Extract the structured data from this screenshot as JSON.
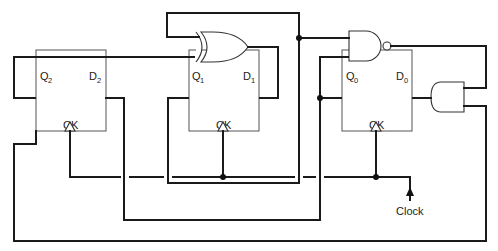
{
  "diagram": {
    "type": "sequential logic circuit",
    "flip_flops": [
      {
        "id": "ff2",
        "q_label": "Q",
        "q_sub": "2",
        "d_label": "D",
        "d_sub": "2",
        "clock_label": "CK"
      },
      {
        "id": "ff1",
        "q_label": "Q",
        "q_sub": "1",
        "d_label": "D",
        "d_sub": "1",
        "clock_label": "CK"
      },
      {
        "id": "ff0",
        "q_label": "Q",
        "q_sub": "0",
        "d_label": "D",
        "d_sub": "0",
        "clock_label": "CK"
      }
    ],
    "gates": [
      {
        "id": "xor",
        "type": "XOR",
        "inputs": [
          "Q1",
          "Q2"
        ],
        "output": "D1"
      },
      {
        "id": "nand",
        "type": "NAND",
        "inputs": [
          "Q1",
          "Q0"
        ],
        "output": "AND.in1"
      },
      {
        "id": "and",
        "type": "AND",
        "inputs": [
          "NAND.out",
          "Q2"
        ],
        "output": "D0"
      }
    ],
    "connections": [
      "Q2 -> XOR.in2",
      "Q1 -> XOR.in1",
      "Q1 -> NAND.in1",
      "Q0 -> NAND.in2",
      "Q0 -> D2",
      "XOR.out -> D1",
      "NAND.out -> AND.in1",
      "Q2 -> AND.in2",
      "AND.out -> D0",
      "Clock -> CK (all)"
    ],
    "clock_input_label": "Clock",
    "line_color": "#1a1a1a"
  }
}
